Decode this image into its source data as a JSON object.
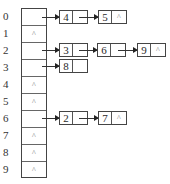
{
  "diagram": {
    "type": "hash-table-separate-chaining",
    "null_symbol": "^",
    "buckets": [
      {
        "index": "0",
        "chain": [
          "4",
          "5"
        ]
      },
      {
        "index": "1",
        "chain": []
      },
      {
        "index": "2",
        "chain": [
          "3",
          "6",
          "9"
        ]
      },
      {
        "index": "3",
        "chain": [
          "8"
        ]
      },
      {
        "index": "4",
        "chain": []
      },
      {
        "index": "5",
        "chain": []
      },
      {
        "index": "6",
        "chain": [
          "2",
          "7"
        ]
      },
      {
        "index": "7",
        "chain": []
      },
      {
        "index": "8",
        "chain": []
      },
      {
        "index": "9",
        "chain": []
      }
    ],
    "labels": [
      "0",
      "1",
      "2",
      "3",
      "4",
      "5",
      "6",
      "7",
      "8",
      "9"
    ],
    "cells": {
      "c1": "^",
      "c4": "^",
      "c5": "^",
      "c7": "^",
      "c8": "^",
      "c9": "^"
    },
    "nodes": {
      "n0a": {
        "value": "4",
        "ptr": ""
      },
      "n0b": {
        "value": "5",
        "ptr": "^"
      },
      "n2a": {
        "value": "3",
        "ptr": ""
      },
      "n2b": {
        "value": "6",
        "ptr": ""
      },
      "n2c": {
        "value": "9",
        "ptr": "^"
      },
      "n3a": {
        "value": "8",
        "ptr": ""
      },
      "n6a": {
        "value": "2",
        "ptr": ""
      },
      "n6b": {
        "value": "7",
        "ptr": "^"
      }
    }
  }
}
